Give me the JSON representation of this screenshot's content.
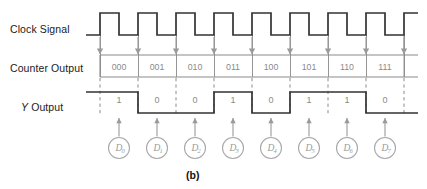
{
  "figure": {
    "caption": "(b)",
    "colors": {
      "waveform": "#333333",
      "grid_gray": "#8a8a8a",
      "arrow_gray": "#9a9a9a",
      "circle_gray": "#a8a8a8",
      "text_dark": "#1a1a1a",
      "text_gray": "#8a8a8a",
      "background": "#ffffff"
    }
  },
  "labels": {
    "clock": "Clock Signal",
    "counter": "Counter Output",
    "y_prefix": "Y",
    "y_suffix": "Output"
  },
  "chart_data": {
    "type": "line",
    "title": "",
    "xlabel": "",
    "ylabel": "",
    "grid": true,
    "legend_position": "none",
    "bit_count": 8,
    "x_start_px": 100,
    "period_px": 38,
    "signals": [
      {
        "name": "Clock Signal",
        "kind": "clock",
        "pulses": 8,
        "duty": 0.5,
        "idle_low_lead": true,
        "values": [
          1,
          0,
          1,
          0,
          1,
          0,
          1,
          0,
          1,
          0,
          1,
          0,
          1,
          0,
          1,
          0
        ]
      },
      {
        "name": "Counter Output",
        "kind": "bus",
        "values": [
          "000",
          "001",
          "010",
          "011",
          "100",
          "101",
          "110",
          "111"
        ]
      },
      {
        "name": "Y Output",
        "kind": "digital",
        "values": [
          "1",
          "0",
          "0",
          "1",
          "0",
          "1",
          "1",
          "0"
        ]
      }
    ],
    "data_inputs": [
      {
        "base": "D",
        "sub": "0"
      },
      {
        "base": "D",
        "sub": "1"
      },
      {
        "base": "D",
        "sub": "2"
      },
      {
        "base": "D",
        "sub": "3"
      },
      {
        "base": "D",
        "sub": "4"
      },
      {
        "base": "D",
        "sub": "5"
      },
      {
        "base": "D",
        "sub": "6"
      },
      {
        "base": "D",
        "sub": "7"
      }
    ]
  }
}
